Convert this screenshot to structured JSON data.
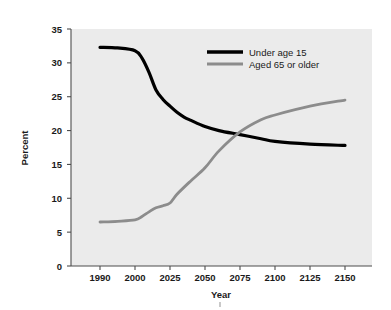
{
  "chart_data": {
    "type": "line",
    "title": "",
    "xlabel": "Year",
    "ylabel": "Percent",
    "ylim": [
      0,
      35
    ],
    "yticks": [
      0,
      5,
      10,
      15,
      20,
      25,
      30,
      35
    ],
    "ytick_labels": [
      "0",
      "5",
      "10",
      "15",
      "20",
      "25",
      "30",
      "35"
    ],
    "x": [
      1990,
      2000,
      2025,
      2050,
      2075,
      2100,
      2125,
      2150
    ],
    "xtick_labels": [
      "1990",
      "2000",
      "2025",
      "2050",
      "2075",
      "2100",
      "2125",
      "2150"
    ],
    "x_spacing": "even-categorical",
    "grid": false,
    "legend_position": "upper-right-inside",
    "background_color": "#ebebeb",
    "series": [
      {
        "name": "Under age 15",
        "color": "#000000",
        "line_width": 3.2,
        "values": [
          32.3,
          31.8,
          23.6,
          20.6,
          19.4,
          18.4,
          18.0,
          17.8
        ],
        "dense_x": [
          1990,
          1995,
          2000,
          2005,
          2010,
          2015,
          2020,
          2025,
          2030,
          2035,
          2040,
          2050,
          2060,
          2075,
          2090,
          2100,
          2125,
          2150
        ],
        "dense_values": [
          32.3,
          32.2,
          31.8,
          30.7,
          28.6,
          26.0,
          24.6,
          23.6,
          22.7,
          22.0,
          21.5,
          20.6,
          20.0,
          19.4,
          18.8,
          18.4,
          18.0,
          17.8
        ]
      },
      {
        "name": "Aged 65 or older",
        "color": "#8c8c8c",
        "line_width": 2.8,
        "values": [
          6.5,
          6.8,
          9.3,
          14.5,
          19.8,
          22.3,
          23.6,
          24.5
        ],
        "dense_x": [
          1990,
          1995,
          2000,
          2005,
          2010,
          2015,
          2020,
          2025,
          2030,
          2040,
          2050,
          2060,
          2075,
          2090,
          2100,
          2125,
          2150
        ],
        "dense_values": [
          6.5,
          6.6,
          6.8,
          7.3,
          8.0,
          8.6,
          8.9,
          9.3,
          10.6,
          12.6,
          14.5,
          17.0,
          19.8,
          21.6,
          22.3,
          23.6,
          24.5
        ]
      }
    ],
    "annotations": {
      "crossover_year_approx": 2072,
      "crossover_percent_approx": 19.5
    }
  },
  "legend": {
    "entries": [
      {
        "label": "Under age 15",
        "color": "#000000"
      },
      {
        "label": "Aged 65 or older",
        "color": "#8c8c8c"
      }
    ]
  },
  "axes": {
    "x_title": "Year",
    "y_title": "Percent"
  },
  "colors": {
    "plot_background": "#ebebeb",
    "page_background": "#ffffff",
    "axis": "#4d4d4d",
    "series_black": "#000000",
    "series_gray": "#8c8c8c"
  }
}
